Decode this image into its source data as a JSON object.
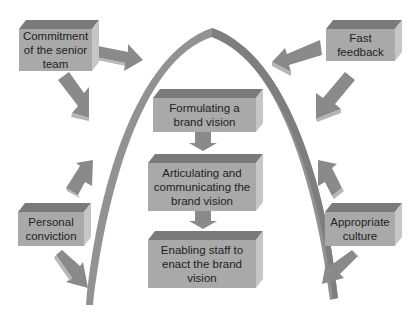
{
  "diagram": {
    "type": "brand-vision-arch",
    "colors": {
      "box_front": "#a9a9a9",
      "box_top": "#7a7a7a",
      "box_side": "#c6c6c6",
      "arrow": "#8a8a8a",
      "arch": "#929292",
      "text": "#222222"
    },
    "center_boxes": [
      {
        "id": "formulating",
        "label": "Formulating a brand vision"
      },
      {
        "id": "articulating",
        "label": "Articulating and communicating the brand vision"
      },
      {
        "id": "enabling",
        "label": "Enabling staff to enact the brand vision"
      }
    ],
    "outer_boxes": [
      {
        "id": "commitment",
        "label": "Commitment of the senior team",
        "position": "top-left"
      },
      {
        "id": "fast-feedback",
        "label": "Fast feedback",
        "position": "top-right"
      },
      {
        "id": "personal-conviction",
        "label": "Personal conviction",
        "position": "bottom-left"
      },
      {
        "id": "appropriate-culture",
        "label": "Appropriate culture",
        "position": "bottom-right"
      }
    ],
    "edges": [
      {
        "from": "formulating",
        "to": "articulating"
      },
      {
        "from": "articulating",
        "to": "enabling"
      },
      {
        "from": "commitment",
        "to": "arch"
      },
      {
        "from": "commitment",
        "to": "arch-left"
      },
      {
        "from": "fast-feedback",
        "to": "arch"
      },
      {
        "from": "fast-feedback",
        "to": "arch-right"
      },
      {
        "from": "personal-conviction",
        "to": "arch-left"
      },
      {
        "from": "personal-conviction",
        "to": "arch-left-base"
      },
      {
        "from": "appropriate-culture",
        "to": "arch-right"
      },
      {
        "from": "appropriate-culture",
        "to": "arch-right-base"
      }
    ]
  }
}
